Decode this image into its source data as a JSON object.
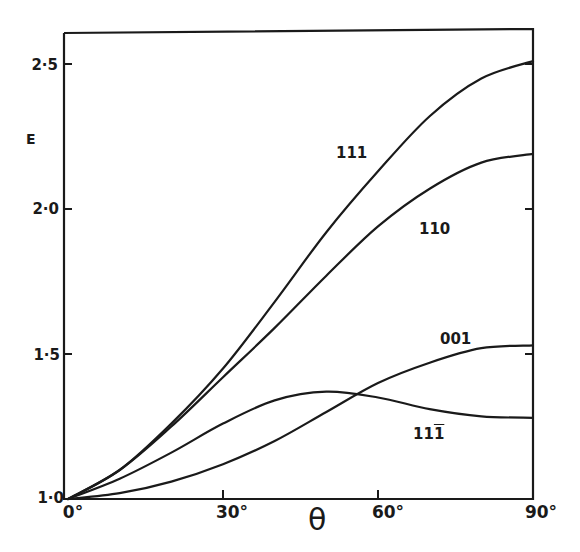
{
  "chart_data": {
    "type": "line",
    "title": "",
    "xlabel": "θ",
    "ylabel": "E",
    "x": [
      0,
      10,
      20,
      30,
      40,
      50,
      60,
      70,
      80,
      90
    ],
    "xlim": [
      0,
      90
    ],
    "ylim": [
      1.0,
      2.6
    ],
    "x_ticks": [
      "0°",
      "30°",
      "60°",
      "90°"
    ],
    "x_tick_values": [
      0,
      30,
      60,
      90
    ],
    "y_ticks": [
      "1·0",
      "1·5",
      "2·0",
      "2·5"
    ],
    "y_tick_values": [
      1.0,
      1.5,
      2.0,
      2.5
    ],
    "grid": false,
    "legend": "inline curve labels",
    "series": [
      {
        "name": "111",
        "values": [
          1.0,
          1.1,
          1.26,
          1.45,
          1.68,
          1.92,
          2.13,
          2.32,
          2.45,
          2.51
        ]
      },
      {
        "name": "110",
        "values": [
          1.0,
          1.1,
          1.25,
          1.42,
          1.59,
          1.77,
          1.94,
          2.07,
          2.16,
          2.19
        ]
      },
      {
        "name": "001",
        "values": [
          1.0,
          1.02,
          1.06,
          1.12,
          1.2,
          1.3,
          1.4,
          1.47,
          1.52,
          1.53
        ]
      },
      {
        "name": "11̄",
        "display": "11T",
        "values": [
          1.0,
          1.07,
          1.16,
          1.26,
          1.34,
          1.37,
          1.35,
          1.31,
          1.285,
          1.28
        ]
      }
    ]
  },
  "labels": {
    "y_axis": "E",
    "x_axis": "θ",
    "y_ticks": [
      "1·0",
      "1·5",
      "2·0",
      "2·5"
    ],
    "x_ticks": [
      "0°",
      "30°",
      "60°",
      "90°"
    ],
    "curve_111": "111",
    "curve_110": "110",
    "curve_001": "001",
    "curve_11bar1_prefix": "11",
    "curve_11bar1_bar": "1"
  }
}
